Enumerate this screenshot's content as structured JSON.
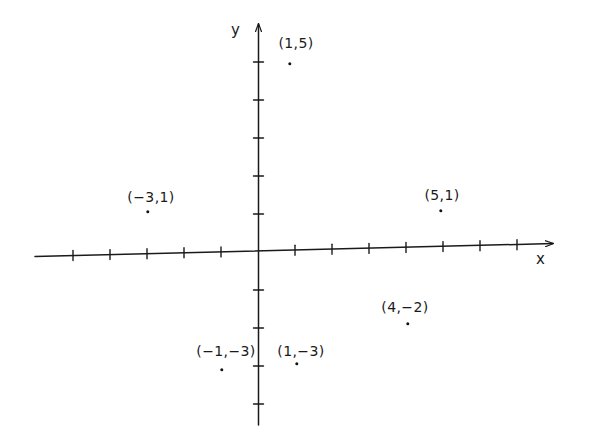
{
  "figure": {
    "background_color": "#ffffff",
    "ink_color": "#1a1a1a",
    "axis_labels": {
      "x": "x",
      "y": "y"
    }
  },
  "chart_data": {
    "type": "scatter",
    "title": "",
    "xlabel": "x",
    "ylabel": "y",
    "grid": false,
    "legend": null,
    "xlim": [
      -6,
      8
    ],
    "ylim": [
      -5,
      6
    ],
    "x_tick_interval": 1,
    "y_tick_interval": 1,
    "points": [
      {
        "label": "(1,5)",
        "x": 1,
        "y": 5
      },
      {
        "label": "(−3,1)",
        "x": -3,
        "y": 1
      },
      {
        "label": "(5,1)",
        "x": 5,
        "y": 1
      },
      {
        "label": "(4,−2)",
        "x": 4,
        "y": -2
      },
      {
        "label": "(−1,−3)",
        "x": -1,
        "y": -3
      },
      {
        "label": "(1,−3)",
        "x": 1,
        "y": -3
      }
    ]
  },
  "points_render": [
    {
      "label": "(1,5)",
      "label_x": 296,
      "label_y": 36,
      "dot_x": 290,
      "dot_y": 64
    },
    {
      "label": "(−3,1)",
      "label_x": 151,
      "label_y": 190,
      "dot_x": 148,
      "dot_y": 212
    },
    {
      "label": "(5,1)",
      "label_x": 442,
      "label_y": 188,
      "dot_x": 441,
      "dot_y": 211
    },
    {
      "label": "(4,−2)",
      "label_x": 405,
      "label_y": 300,
      "dot_x": 408,
      "dot_y": 324
    },
    {
      "label": "(−1,−3)",
      "label_x": 226,
      "label_y": 344,
      "dot_x": 222,
      "dot_y": 370
    },
    {
      "label": "(1,−3)",
      "label_x": 301,
      "label_y": 344,
      "dot_x": 297,
      "dot_y": 364
    }
  ]
}
